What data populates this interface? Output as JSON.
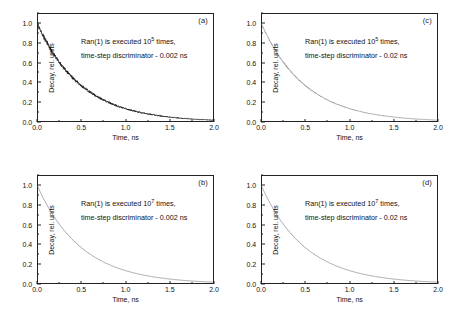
{
  "figure": {
    "panels": [
      {
        "id": "a",
        "label": "(a)",
        "annotation_line1_pre": "Ran(1) is executed 10",
        "annotation_line1_sup": "5",
        "annotation_line1_post": " times,",
        "annotation_line2": "time-step discriminator - 0.002 ns",
        "executions": "10^5",
        "time_step_discriminator_ns": 0.002,
        "noise_amplitude": 0.022,
        "xlabel": "Time, ns",
        "ylabel": "Decay, rel. units"
      },
      {
        "id": "c",
        "label": "(c)",
        "annotation_line1_pre": "Ran(1) is executed 10",
        "annotation_line1_sup": "5",
        "annotation_line1_post": " times,",
        "annotation_line2": "time-step discriminator - 0.02 ns",
        "executions": "10^5",
        "time_step_discriminator_ns": 0.02,
        "noise_amplitude": 0.007,
        "xlabel": "Time, ns",
        "ylabel": "Decay, rel. units"
      },
      {
        "id": "b",
        "label": "(b)",
        "annotation_line1_pre": "Ran(1) is executed 10",
        "annotation_line1_sup": "7",
        "annotation_line1_post": " times,",
        "annotation_line2": "time-step discriminator - 0.002 ns",
        "executions": "10^7",
        "time_step_discriminator_ns": 0.002,
        "noise_amplitude": 0.002,
        "xlabel": "Time, ns",
        "ylabel": "Decay, rel. units"
      },
      {
        "id": "d",
        "label": "(d)",
        "annotation_line1_pre": "Ran(1) is executed 10",
        "annotation_line1_sup": "7",
        "annotation_line1_post": " times,",
        "annotation_line2": "time-step discriminator - 0.02 ns",
        "executions": "10^7",
        "time_step_discriminator_ns": 0.02,
        "noise_amplitude": 0.0015,
        "xlabel": "Time, ns",
        "ylabel": "Decay, rel. units"
      }
    ],
    "axis": {
      "x_ticks": [
        "0.0",
        "0.5",
        "1.0",
        "1.5",
        "2.0"
      ],
      "x_tick_values": [
        0.0,
        0.5,
        1.0,
        1.5,
        2.0
      ],
      "y_ticks": [
        "0.0",
        "0.2",
        "0.4",
        "0.6",
        "0.8",
        "1.0"
      ],
      "y_tick_values": [
        0.0,
        0.2,
        0.4,
        0.6,
        0.8,
        1.0
      ],
      "xlim": [
        0.0,
        2.0
      ],
      "ylim": [
        0.0,
        1.1
      ]
    },
    "colors": {
      "curve": "#1a1a1a",
      "curve_light": "#6b6b6b",
      "frame": "#222222",
      "text": "#111111",
      "background": "#ffffff"
    }
  },
  "chart_data": [
    {
      "type": "line",
      "title": "(a)",
      "xlabel": "Time, ns",
      "ylabel": "Decay, rel. units",
      "xlim": [
        0.0,
        2.0
      ],
      "ylim": [
        0.0,
        1.1
      ],
      "grid": false,
      "legend": "none",
      "annotations": [
        "Ran(1) is executed 10^5 times,",
        "time-step discriminator - 0.002 ns"
      ],
      "model": "exponential decay, tau = 0.5 ns, amplitude 1.0, with Monte-Carlo sampling noise",
      "x": [
        0.0,
        0.1,
        0.2,
        0.3,
        0.4,
        0.5,
        0.6,
        0.7,
        0.8,
        0.9,
        1.0,
        1.1,
        1.2,
        1.3,
        1.4,
        1.5,
        1.6,
        1.7,
        1.8,
        1.9,
        2.0
      ],
      "values": [
        1.0,
        0.82,
        0.67,
        0.55,
        0.45,
        0.37,
        0.3,
        0.25,
        0.2,
        0.165,
        0.135,
        0.111,
        0.091,
        0.074,
        0.061,
        0.05,
        0.041,
        0.033,
        0.027,
        0.022,
        0.018
      ]
    },
    {
      "type": "line",
      "title": "(c)",
      "xlabel": "Time, ns",
      "ylabel": "Decay, rel. units",
      "xlim": [
        0.0,
        2.0
      ],
      "ylim": [
        0.0,
        1.1
      ],
      "grid": false,
      "legend": "none",
      "annotations": [
        "Ran(1) is executed 10^5 times,",
        "time-step discriminator - 0.02 ns"
      ],
      "model": "exponential decay, tau = 0.5 ns, amplitude 1.0, coarse time step",
      "x": [
        0.0,
        0.1,
        0.2,
        0.3,
        0.4,
        0.5,
        0.6,
        0.7,
        0.8,
        0.9,
        1.0,
        1.1,
        1.2,
        1.3,
        1.4,
        1.5,
        1.6,
        1.7,
        1.8,
        1.9,
        2.0
      ],
      "values": [
        1.0,
        0.82,
        0.67,
        0.55,
        0.45,
        0.37,
        0.3,
        0.25,
        0.2,
        0.165,
        0.135,
        0.111,
        0.091,
        0.074,
        0.061,
        0.05,
        0.041,
        0.033,
        0.027,
        0.022,
        0.018
      ]
    },
    {
      "type": "line",
      "title": "(b)",
      "xlabel": "Time, ns",
      "ylabel": "Decay, rel. units",
      "xlim": [
        0.0,
        2.0
      ],
      "ylim": [
        0.0,
        1.1
      ],
      "grid": false,
      "legend": "none",
      "annotations": [
        "Ran(1) is executed 10^7 times,",
        "time-step discriminator - 0.002 ns"
      ],
      "model": "exponential decay, tau = 0.5 ns, amplitude 1.0, low noise",
      "x": [
        0.0,
        0.1,
        0.2,
        0.3,
        0.4,
        0.5,
        0.6,
        0.7,
        0.8,
        0.9,
        1.0,
        1.1,
        1.2,
        1.3,
        1.4,
        1.5,
        1.6,
        1.7,
        1.8,
        1.9,
        2.0
      ],
      "values": [
        1.0,
        0.82,
        0.67,
        0.55,
        0.45,
        0.37,
        0.3,
        0.25,
        0.2,
        0.165,
        0.135,
        0.111,
        0.091,
        0.074,
        0.061,
        0.05,
        0.041,
        0.033,
        0.027,
        0.022,
        0.018
      ]
    },
    {
      "type": "line",
      "title": "(d)",
      "xlabel": "Time, ns",
      "ylabel": "Decay, rel. units",
      "xlim": [
        0.0,
        2.0
      ],
      "ylim": [
        0.0,
        1.1
      ],
      "grid": false,
      "legend": "none",
      "annotations": [
        "Ran(1) is executed 10^7 times,",
        "time-step discriminator - 0.02 ns"
      ],
      "model": "exponential decay, tau = 0.5 ns, amplitude 1.0, low noise",
      "x": [
        0.0,
        0.1,
        0.2,
        0.3,
        0.4,
        0.5,
        0.6,
        0.7,
        0.8,
        0.9,
        1.0,
        1.1,
        1.2,
        1.3,
        1.4,
        1.5,
        1.6,
        1.7,
        1.8,
        1.9,
        2.0
      ],
      "values": [
        1.0,
        0.82,
        0.67,
        0.55,
        0.45,
        0.37,
        0.3,
        0.25,
        0.2,
        0.165,
        0.135,
        0.111,
        0.091,
        0.074,
        0.061,
        0.05,
        0.041,
        0.033,
        0.027,
        0.022,
        0.018
      ]
    }
  ]
}
